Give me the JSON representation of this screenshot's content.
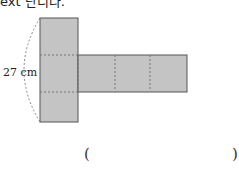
{
  "question": {
    "partial_text": "ext 단니다.",
    "dimension_label": "27 cm",
    "answer_open": "(",
    "answer_close": ")"
  },
  "figure": {
    "fill_color": "#c4c4c4",
    "stroke_color": "#555555",
    "dashed_color": "#777777"
  }
}
